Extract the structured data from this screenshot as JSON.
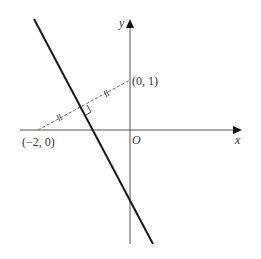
{
  "diagram": {
    "type": "coordinate-geometry",
    "axes": {
      "x_label": "x",
      "y_label": "y",
      "origin_label": "O"
    },
    "points": [
      {
        "label": "(−2, 0)",
        "x": -2,
        "y": 0
      },
      {
        "label": "(0, 1)",
        "x": 0,
        "y": 1
      }
    ],
    "segments": [
      {
        "name": "perpendicular-bisector-line",
        "style": "solid-thick"
      },
      {
        "name": "segment-between-points",
        "from": "(−2, 0)",
        "to": "(0, 1)",
        "style": "dashed",
        "equal_halves_marked": true,
        "right_angle_at_intersection": true
      }
    ],
    "colors": {
      "line": "#1a1a1a",
      "axis": "#555555",
      "dashed": "#666666",
      "text": "#333333"
    }
  }
}
